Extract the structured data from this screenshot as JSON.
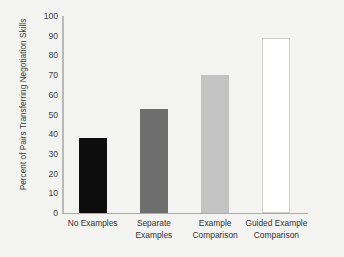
{
  "chart_data": {
    "type": "bar",
    "title": "",
    "subtitle": "",
    "xlabel": "",
    "ylabel": "Percent of Pairs Transferring Negotiation Skills",
    "categories": [
      "No Examples",
      "Separate Examples",
      "Example Comparison",
      "Guided Example Comparison"
    ],
    "values": [
      38,
      53,
      70,
      89
    ],
    "ylim": [
      0,
      100
    ],
    "yticks": [
      0,
      10,
      20,
      30,
      40,
      50,
      60,
      70,
      80,
      90,
      100
    ],
    "ytick_labels": [
      "0",
      "10",
      "20",
      "30",
      "40",
      "50",
      "60",
      "70",
      "80",
      "90",
      "100"
    ],
    "grid": false,
    "legend": null,
    "bar_colors": [
      "#0d0d0d",
      "#6e6e6e",
      "#c3c3c3",
      "#ffffff"
    ],
    "bar_border_colors": [
      "#0d0d0d",
      "#6e6e6e",
      "#c3c3c3",
      "#cfcfcf"
    ],
    "category_lines": [
      [
        "No Examples"
      ],
      [
        "Separate",
        "Examples"
      ],
      [
        "Example",
        "Comparison"
      ],
      [
        "Guided Example",
        "Comparison"
      ]
    ],
    "axis_color": "#b0b0b0",
    "background_color": "#f3f3f1",
    "text_color": "#3a3a3a"
  }
}
